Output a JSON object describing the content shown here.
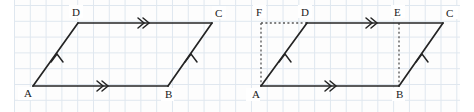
{
  "figure": {
    "background": "#fdfdfd",
    "grid_color": "#dfe7ef",
    "line_color": "#242424",
    "dash_color": "#555555",
    "grid_cell_px": 15.8
  },
  "left_figure": {
    "name": "parallelogram-ABCD",
    "vertices": [
      {
        "id": "A",
        "label": "A",
        "x": 33,
        "y": 86,
        "label_x": 24,
        "label_y": 96
      },
      {
        "id": "B",
        "label": "B",
        "x": 168,
        "y": 86,
        "label_x": 165,
        "label_y": 98
      },
      {
        "id": "C",
        "label": "C",
        "x": 212,
        "y": 23,
        "label_x": 215,
        "label_y": 17
      },
      {
        "id": "D",
        "label": "D",
        "x": 78,
        "y": 23,
        "label_x": 73,
        "label_y": 15
      }
    ],
    "edges": [
      {
        "from": "A",
        "to": "B",
        "marks": 2,
        "style": "solid"
      },
      {
        "from": "B",
        "to": "C",
        "marks": 1,
        "style": "solid"
      },
      {
        "from": "D",
        "to": "C",
        "marks": 2,
        "style": "solid"
      },
      {
        "from": "A",
        "to": "D",
        "marks": 1,
        "style": "solid"
      }
    ]
  },
  "right_figure": {
    "name": "parallelogram-ABCD-with-rectangle-AFEB",
    "vertices": [
      {
        "id": "A",
        "label": "A",
        "x": 261,
        "y": 86,
        "label_x": 252,
        "label_y": 97
      },
      {
        "id": "B",
        "label": "B",
        "x": 399,
        "y": 86,
        "label_x": 396,
        "label_y": 98
      },
      {
        "id": "C",
        "label": "C",
        "x": 443,
        "y": 23,
        "label_x": 446,
        "label_y": 17
      },
      {
        "id": "D",
        "label": "D",
        "x": 307,
        "y": 23,
        "label_x": 302,
        "label_y": 15
      },
      {
        "id": "E",
        "label": "E",
        "x": 399,
        "y": 23,
        "label_x": 395,
        "label_y": 15
      },
      {
        "id": "F",
        "label": "F",
        "x": 261,
        "y": 23,
        "label_x": 256,
        "label_y": 15
      }
    ],
    "edges": [
      {
        "from": "A",
        "to": "B",
        "marks": 2,
        "style": "solid"
      },
      {
        "from": "B",
        "to": "C",
        "marks": 1,
        "style": "solid"
      },
      {
        "from": "D",
        "to": "C",
        "marks": 2,
        "style": "solid"
      },
      {
        "from": "A",
        "to": "D",
        "marks": 1,
        "style": "solid"
      },
      {
        "from": "F",
        "to": "D",
        "marks": 0,
        "style": "dashed"
      },
      {
        "from": "F",
        "to": "A",
        "marks": 0,
        "style": "dashed"
      },
      {
        "from": "E",
        "to": "B",
        "marks": 0,
        "style": "dashed"
      },
      {
        "from": "D",
        "to": "E",
        "marks": 0,
        "style": "solid"
      }
    ]
  },
  "labels": {
    "A": "A",
    "B": "B",
    "C": "C",
    "D": "D",
    "E": "E",
    "F": "F"
  }
}
